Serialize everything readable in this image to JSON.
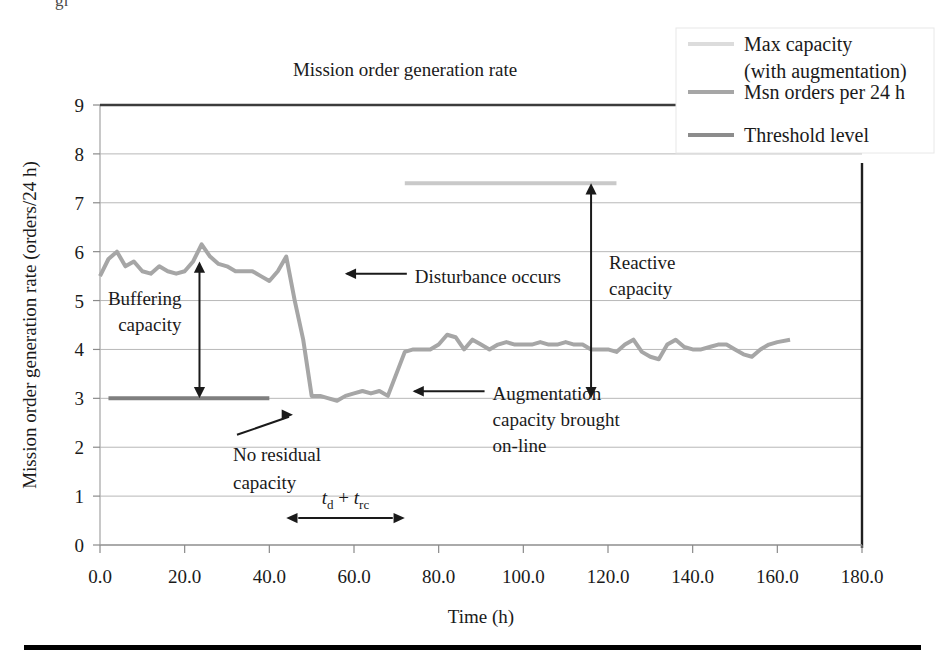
{
  "figure": {
    "bottom_rule": true,
    "top_clipped_text": "gr     "
  },
  "chart_data": {
    "type": "line",
    "title": "Mission order generation rate",
    "xlabel": "Time (h)",
    "ylabel": "Mission order generation rate (orders/24 h)",
    "xlim": [
      0,
      180
    ],
    "ylim": [
      0,
      9
    ],
    "xticks": [
      "0.0",
      "20.0",
      "40.0",
      "60.0",
      "80.0",
      "100.0",
      "120.0",
      "140.0",
      "160.0",
      "180.0"
    ],
    "yticks": [
      "0",
      "1",
      "2",
      "3",
      "4",
      "5",
      "6",
      "7",
      "8",
      "9"
    ],
    "grid": "horizontal",
    "legend_position": "top-right",
    "series": [
      {
        "name": "Max capacity (with augmentation)",
        "color": "#c9c9c9",
        "width": 4,
        "x": [
          72,
          122
        ],
        "values": [
          7.4,
          7.4
        ]
      },
      {
        "name": "Msn orders per 24 h",
        "color": "#a6a6a6",
        "width": 4,
        "x": [
          0,
          2,
          4,
          6,
          8,
          10,
          12,
          14,
          16,
          18,
          20,
          22,
          24,
          26,
          28,
          30,
          32,
          34,
          36,
          38,
          40,
          42,
          44,
          46,
          48,
          50,
          52,
          54,
          56,
          58,
          60,
          62,
          64,
          66,
          68,
          70,
          72,
          74,
          76,
          78,
          80,
          82,
          84,
          86,
          88,
          90,
          92,
          94,
          96,
          98,
          100,
          102,
          104,
          106,
          108,
          110,
          112,
          114,
          116,
          118,
          120,
          122,
          124,
          126,
          128,
          130,
          132,
          134,
          136,
          138,
          140,
          142,
          144,
          146,
          148,
          150,
          152,
          154,
          156,
          158,
          160,
          163
        ],
        "values": [
          5.5,
          5.85,
          6.0,
          5.7,
          5.8,
          5.6,
          5.55,
          5.7,
          5.6,
          5.55,
          5.6,
          5.8,
          6.15,
          5.9,
          5.75,
          5.7,
          5.6,
          5.6,
          5.6,
          5.5,
          5.4,
          5.6,
          5.9,
          5.0,
          4.2,
          3.05,
          3.05,
          3.0,
          2.95,
          3.05,
          3.1,
          3.15,
          3.1,
          3.15,
          3.05,
          3.5,
          3.95,
          4.0,
          4.0,
          4.0,
          4.1,
          4.3,
          4.25,
          4.0,
          4.2,
          4.1,
          4.0,
          4.1,
          4.15,
          4.1,
          4.1,
          4.1,
          4.15,
          4.1,
          4.1,
          4.15,
          4.1,
          4.1,
          4.0,
          4.0,
          4.0,
          3.95,
          4.1,
          4.2,
          3.95,
          3.85,
          3.8,
          4.1,
          4.2,
          4.05,
          4.0,
          4.0,
          4.05,
          4.1,
          4.1,
          4.0,
          3.9,
          3.85,
          4.0,
          4.1,
          4.15,
          4.2
        ]
      },
      {
        "name": "Threshold level",
        "color": "#7f7f7f",
        "width": 4,
        "x": [
          2,
          40
        ],
        "values": [
          3.0,
          3.0
        ]
      }
    ],
    "top_border_line": {
      "note": "dark line drawn across top of plot at y=9",
      "color": "#3c3c3c",
      "y": 9,
      "x": [
        0,
        155
      ]
    },
    "annotations": [
      {
        "id": "buffering-capacity",
        "text": "Buffering\ncapacity",
        "line1": "Buffering",
        "line2": "capacity",
        "kind": "double-arrow",
        "from_y": 3.0,
        "to_y": 5.8,
        "at_x": 23.5
      },
      {
        "id": "disturbance-occurs",
        "text": "Disturbance occurs",
        "kind": "left-arrow",
        "at_x": 55,
        "at_y": 5.55
      },
      {
        "id": "no-residual-capacity",
        "line1": "No residual",
        "line2": "capacity",
        "kind": "right-arrow",
        "at_x": 47,
        "at_y": 2.95
      },
      {
        "id": "augmentation-capacity",
        "line1": "Augmentation",
        "line2": "capacity brought",
        "line3": "on-line",
        "kind": "left-arrow",
        "at_x": 71,
        "at_y": 3.35
      },
      {
        "id": "reactive-capacity",
        "line1": "Reactive",
        "line2": "capacity",
        "kind": "double-arrow",
        "from_y": 3.0,
        "to_y": 7.4,
        "at_x": 116
      },
      {
        "id": "delay-time",
        "math_main": "t",
        "math_sub1": "d",
        "math_plus": " + ",
        "math_main2": "t",
        "math_sub2": "rc",
        "display": "t_d + t_rc",
        "kind": "double-arrow-horizontal",
        "from_x": 44,
        "to_x": 72,
        "at_y": 0.55
      }
    ],
    "legend": [
      {
        "label_line1": "Max capacity",
        "label_line2": "(with augmentation)",
        "swatch_color": "#dcdcdc"
      },
      {
        "label_line1": "Msn orders per 24 h",
        "label_line2": "",
        "swatch_color": "#a6a6a6"
      },
      {
        "label_line1": "Threshold level",
        "label_line2": "",
        "swatch_color": "#8c8c8c"
      }
    ]
  }
}
